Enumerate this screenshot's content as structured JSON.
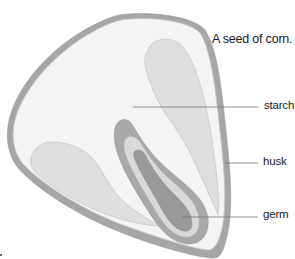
{
  "title": "A seed of corn.",
  "labels": {
    "starch": "starch",
    "husk": "husk",
    "germ": "germ"
  },
  "colors": {
    "husk_outer": "#a6a6a6",
    "husk_inner_line": "#c8c8c8",
    "starch_bg": "#f4f4f4",
    "endosperm_lobe": "#dedede",
    "germ_outer": "#a8a8a8",
    "germ_middle": "#d9d9d9",
    "germ_inner": "#9a9a9a",
    "leader_line": "#7a7a7a",
    "text": "#1a1a1a"
  }
}
